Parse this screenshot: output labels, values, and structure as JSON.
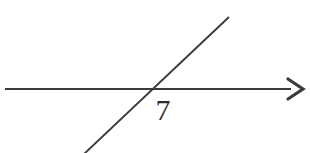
{
  "figure": {
    "background_color": "#ffffff",
    "stroke_color": "#3b3b3b",
    "width": 310,
    "height": 153,
    "horizontal_line": {
      "name": "horizontal-ray",
      "x1": 5,
      "y1": 89,
      "x2": 291,
      "y2": 89,
      "stroke_width": 1.9,
      "has_arrowhead": true
    },
    "arrowhead": {
      "name": "right-arrowhead",
      "tip_x": 303,
      "tip_y": 89,
      "back_x": 288,
      "top_y": 79,
      "bottom_y": 99,
      "stroke_width": 3.2
    },
    "diagonal_line": {
      "name": "diagonal-transversal",
      "x1": 84,
      "y1": 154,
      "x2": 229,
      "y2": 17,
      "stroke_width": 1.9
    },
    "intersection": {
      "x": 152,
      "y": 89
    },
    "label": {
      "text": "7",
      "x": 163,
      "y": 120,
      "font_size": 30,
      "color": "#2e2e2e"
    }
  }
}
